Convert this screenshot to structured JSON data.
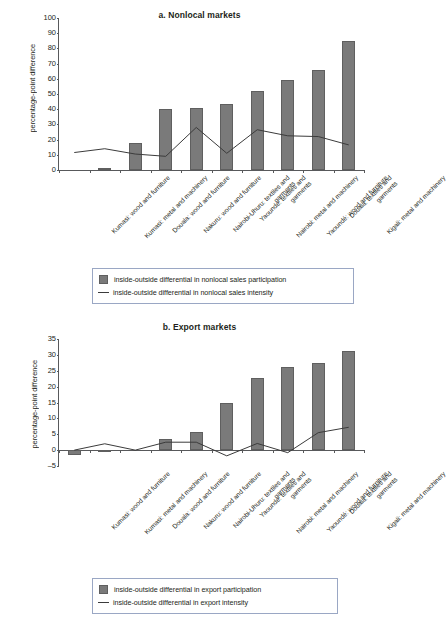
{
  "figure": {
    "categories": [
      "Kumasi: wood and furniture",
      "Kumasi: metal and machinery",
      "Douala: wood and furniture",
      "Nakuru: wood and furniture",
      "Nairobi-Uhuru: textiles and garments",
      "Yaoundé: textiles and garments",
      "Nairobi: metal and machinery",
      "Yaoundé: wood and furniture",
      "Douala: textiles and garments",
      "Kigali: metal and machinery"
    ],
    "bar_color": "#7a7a7a",
    "line_color": "#3b3b3b"
  },
  "panel_a": {
    "title": "a. Nonlocal markets",
    "ylabel": "percentage-point difference",
    "yticks": [
      "0",
      "10",
      "20",
      "30",
      "40",
      "50",
      "60",
      "70",
      "80",
      "90",
      "100"
    ],
    "legend": {
      "bar_label": "inside-outside differential in nonlocal sales participation",
      "line_label": "inside-outside differential in nonlocal sales intensity"
    }
  },
  "panel_b": {
    "title": "b. Export markets",
    "ylabel": "percentage-point difference",
    "yticks": [
      "-5",
      "0",
      "5",
      "10",
      "15",
      "20",
      "25",
      "30",
      "35"
    ],
    "legend": {
      "bar_label": "inside-outside differential in export participation",
      "line_label": "inside-outside differential in export intensity"
    }
  },
  "chart_data": [
    {
      "type": "bar",
      "panel": "a",
      "title": "a. Nonlocal markets",
      "xlabel": "",
      "ylabel": "percentage-point difference",
      "ylim": [
        0,
        100
      ],
      "ytick_step": 10,
      "grid": false,
      "legend_position": "bottom",
      "categories": [
        "Kumasi: wood and furniture",
        "Kumasi: metal and machinery",
        "Douala: wood and furniture",
        "Nakuru: wood and furniture",
        "Nairobi-Uhuru: textiles and garments",
        "Yaoundé: textiles and garments",
        "Nairobi: metal and machinery",
        "Yaoundé: wood and furniture",
        "Douala: textiles and garments",
        "Kigali: metal and machinery"
      ],
      "series": [
        {
          "name": "inside-outside differential in nonlocal sales participation",
          "type": "bar",
          "values": [
            0,
            1.0,
            17.5,
            40.0,
            41.0,
            43.5,
            52.0,
            59.0,
            65.5,
            85.0
          ]
        },
        {
          "name": "inside-outside differential in nonlocal sales intensity",
          "type": "line",
          "values": [
            11.5,
            14.0,
            10.5,
            9.0,
            28.0,
            11.0,
            26.5,
            22.5,
            22.0,
            16.5
          ]
        }
      ]
    },
    {
      "type": "bar",
      "panel": "b",
      "title": "b. Export markets",
      "xlabel": "",
      "ylabel": "percentage-point difference",
      "ylim": [
        -5,
        35
      ],
      "ytick_step": 5,
      "grid": false,
      "legend_position": "bottom",
      "categories": [
        "Kumasi: wood and furniture",
        "Kumasi: metal and machinery",
        "Douala: wood and furniture",
        "Nakuru: wood and furniture",
        "Nairobi-Uhuru: textiles and garments",
        "Yaoundé: textiles and garments",
        "Nairobi: metal and machinery",
        "Yaoundé: wood and furniture",
        "Douala: textiles and garments",
        "Kigali: metal and machinery"
      ],
      "series": [
        {
          "name": "inside-outside differential in export participation",
          "type": "bar",
          "values": [
            -1.5,
            -0.3,
            0,
            3.6,
            5.7,
            14.8,
            22.7,
            26.2,
            27.5,
            31.1
          ]
        },
        {
          "name": "inside-outside differential in export intensity",
          "type": "line",
          "values": [
            0,
            2.0,
            0,
            2.5,
            2.5,
            -1.8,
            2.1,
            -0.8,
            5.5,
            7.2
          ]
        }
      ]
    }
  ]
}
